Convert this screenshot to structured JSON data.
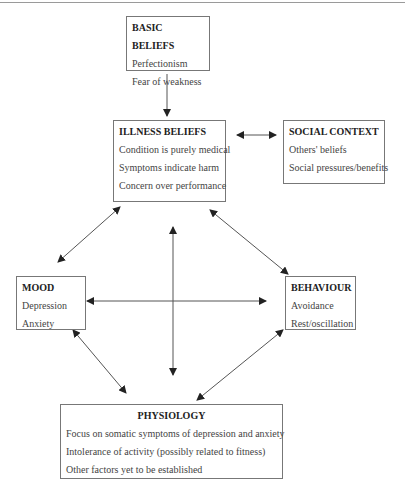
{
  "diagram": {
    "boxes": {
      "basic_beliefs": {
        "title": "BASIC BELIEFS",
        "items": [
          "Perfectionism",
          "Fear of weakness"
        ]
      },
      "illness_beliefs": {
        "title": "ILLNESS BELIEFS",
        "items": [
          "Condition is purely medical",
          "Symptoms indicate harm",
          "Concern over performance"
        ]
      },
      "social_context": {
        "title": "SOCIAL CONTEXT",
        "items": [
          "Others' beliefs",
          "Social pressures/benefits"
        ]
      },
      "mood": {
        "title": "MOOD",
        "items": [
          "Depression",
          "Anxiety"
        ]
      },
      "behaviour": {
        "title": "BEHAVIOUR",
        "items": [
          "Avoidance",
          "Rest/oscillation"
        ]
      },
      "physiology": {
        "title": "PHYSIOLOGY",
        "items": [
          "Focus on somatic symptoms of depression and anxiety",
          "Intolerance of activity (possibly related to fitness)",
          "Other factors yet to be established"
        ]
      }
    },
    "connections": [
      {
        "from": "basic_beliefs",
        "to": "illness_beliefs",
        "type": "one-way"
      },
      {
        "from": "illness_beliefs",
        "to": "social_context",
        "type": "two-way"
      },
      {
        "from": "illness_beliefs",
        "to": "mood",
        "type": "two-way"
      },
      {
        "from": "illness_beliefs",
        "to": "behaviour",
        "type": "two-way"
      },
      {
        "from": "mood",
        "to": "behaviour",
        "type": "two-way"
      },
      {
        "from": "illness_beliefs",
        "to": "physiology",
        "type": "two-way"
      },
      {
        "from": "mood",
        "to": "physiology",
        "type": "two-way"
      },
      {
        "from": "behaviour",
        "to": "physiology",
        "type": "two-way"
      }
    ],
    "colors": {
      "border": "#777777",
      "arrow": "#555555",
      "text": "#333333"
    }
  }
}
